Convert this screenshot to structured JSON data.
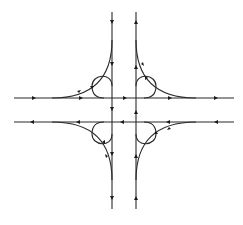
{
  "diagram": {
    "type": "cloverleaf-interchange",
    "colors": {
      "line": "#2a2a2a",
      "arrow": "#1a1a1a",
      "background": "#ffffff"
    },
    "mainlines": [
      {
        "name": "westbound",
        "y": 98,
        "direction": "left"
      },
      {
        "name": "eastbound",
        "y": 122,
        "direction": "right"
      },
      {
        "name": "southbound",
        "x": 112,
        "direction": "down"
      },
      {
        "name": "northbound",
        "x": 136,
        "direction": "up"
      }
    ],
    "outer_ramps": [
      "northwest",
      "northeast",
      "southwest",
      "southeast"
    ],
    "loop_ramps": [
      "northwest",
      "northeast",
      "southwest",
      "southeast"
    ]
  }
}
